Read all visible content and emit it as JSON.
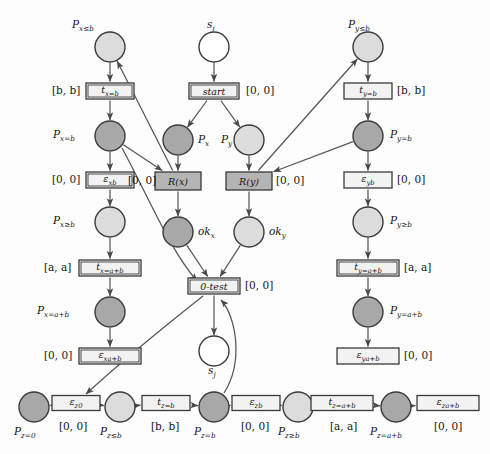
{
  "figure": {
    "kind": "petri-net",
    "colors": {
      "place_dark": "#a8a8a8",
      "place_light": "#dcdcdc",
      "place_white": "#ffffff",
      "transition_light": "#f2f2f2",
      "transition_gray": "#b4b4b4",
      "stroke": "#3a3a3a",
      "arc": "#555555",
      "background": "#fdfdfd"
    }
  },
  "places": [
    {
      "id": "Px_le_b",
      "label": "P",
      "sub": "x≤b",
      "fill": "place_light",
      "x": 110,
      "y": 47,
      "label_x": 72,
      "label_y": 18
    },
    {
      "id": "Px_eq_b",
      "label": "P",
      "sub": "x=b",
      "fill": "place_dark",
      "x": 110,
      "y": 136,
      "label_x": 53,
      "label_y": 128
    },
    {
      "id": "Px_ge_b",
      "label": "P",
      "sub": "x≥b",
      "fill": "place_light",
      "x": 110,
      "y": 222,
      "label_x": 53,
      "label_y": 214
    },
    {
      "id": "Px_eq_ab",
      "label": "P",
      "sub": "x=a+b",
      "fill": "place_dark",
      "x": 110,
      "y": 312,
      "label_x": 37,
      "label_y": 304
    },
    {
      "id": "s_i",
      "label": "s",
      "sub": "i",
      "fill": "place_white",
      "x": 214,
      "y": 47,
      "label_x": 207,
      "label_y": 18
    },
    {
      "id": "P_x",
      "label": "P",
      "sub": "x",
      "fill": "place_dark",
      "x": 178,
      "y": 140,
      "label_x": 198,
      "label_y": 133
    },
    {
      "id": "P_y",
      "label": "P",
      "sub": "y",
      "fill": "place_light",
      "x": 249,
      "y": 140,
      "label_x": 221,
      "label_y": 133
    },
    {
      "id": "ok_x",
      "label": "ok",
      "sub": "x",
      "fill": "place_dark",
      "x": 178,
      "y": 232,
      "label_x": 198,
      "label_y": 225
    },
    {
      "id": "ok_y",
      "label": "ok",
      "sub": "y",
      "fill": "place_light",
      "x": 249,
      "y": 232,
      "label_x": 269,
      "label_y": 225
    },
    {
      "id": "s_j",
      "label": "s",
      "sub": "j",
      "fill": "place_white",
      "x": 214,
      "y": 351,
      "label_x": 208,
      "label_y": 364
    },
    {
      "id": "Py_le_b",
      "label": "P",
      "sub": "y≤b",
      "fill": "place_light",
      "x": 368,
      "y": 47,
      "label_x": 348,
      "label_y": 18
    },
    {
      "id": "Py_eq_b",
      "label": "P",
      "sub": "y=b",
      "fill": "place_dark",
      "x": 368,
      "y": 136,
      "label_x": 390,
      "label_y": 128
    },
    {
      "id": "Py_ge_b",
      "label": "P",
      "sub": "y≥b",
      "fill": "place_light",
      "x": 368,
      "y": 222,
      "label_x": 390,
      "label_y": 214
    },
    {
      "id": "Py_eq_ab",
      "label": "P",
      "sub": "y=a+b",
      "fill": "place_dark",
      "x": 368,
      "y": 312,
      "label_x": 390,
      "label_y": 304
    },
    {
      "id": "Pz_eq_0",
      "label": "P",
      "sub": "z=0",
      "fill": "place_dark",
      "x": 34,
      "y": 407,
      "label_x": 14,
      "label_y": 425
    },
    {
      "id": "Pz_le_b",
      "label": "P",
      "sub": "z≤b",
      "fill": "place_light",
      "x": 120,
      "y": 407,
      "label_x": 100,
      "label_y": 425
    },
    {
      "id": "Pz_eq_b",
      "label": "P",
      "sub": "z=b",
      "fill": "place_dark",
      "x": 214,
      "y": 407,
      "label_x": 194,
      "label_y": 425
    },
    {
      "id": "Pz_ge_b",
      "label": "P",
      "sub": "z≥b",
      "fill": "place_light",
      "x": 298,
      "y": 407,
      "label_x": 278,
      "label_y": 425
    },
    {
      "id": "Pz_eq_ab",
      "label": "P",
      "sub": "z=a+b",
      "fill": "place_dark",
      "x": 396,
      "y": 407,
      "label_x": 370,
      "label_y": 425
    }
  ],
  "transitions": [
    {
      "id": "tx_eq_b",
      "text": "t",
      "sub": "x=b",
      "style": "double",
      "fill": "transition_light",
      "x": 110,
      "y": 91,
      "w": 48,
      "h": 16,
      "iv": "[b, b]",
      "iv_x": 52,
      "iv_y": 84
    },
    {
      "id": "eps_xb",
      "text": "ε",
      "sub": "x_b",
      "style": "double",
      "fill": "transition_light",
      "x": 110,
      "y": 180,
      "w": 48,
      "h": 16,
      "iv": "[0, 0]",
      "iv_x": 52,
      "iv_y": 173
    },
    {
      "id": "tx_eq_ab",
      "text": "t",
      "sub": "x=a+b",
      "style": "double",
      "fill": "transition_light",
      "x": 110,
      "y": 268,
      "w": 62,
      "h": 16,
      "iv": "[a, a]",
      "iv_x": 44,
      "iv_y": 261
    },
    {
      "id": "eps_x_ab",
      "text": "ε",
      "sub": "x_a+b",
      "style": "double",
      "fill": "transition_light",
      "x": 110,
      "y": 356,
      "w": 62,
      "h": 16,
      "iv": "[0, 0]",
      "iv_x": 44,
      "iv_y": 349
    },
    {
      "id": "start",
      "text": "start",
      "sub": "",
      "style": "double",
      "fill": "transition_light",
      "x": 214,
      "y": 91,
      "w": 50,
      "h": 16,
      "iv": "[0, 0]",
      "iv_x": 246,
      "iv_y": 84
    },
    {
      "id": "R_x",
      "text": "R(x)",
      "sub": "",
      "style": "gray",
      "fill": "transition_gray",
      "x": 178,
      "y": 181,
      "w": 46,
      "h": 18,
      "iv": "[0, 0]",
      "iv_x": 128,
      "iv_y": 174
    },
    {
      "id": "R_y",
      "text": "R(y)",
      "sub": "",
      "style": "gray",
      "fill": "transition_gray",
      "x": 249,
      "y": 181,
      "w": 46,
      "h": 18,
      "iv": "[0, 0]",
      "iv_x": 276,
      "iv_y": 174
    },
    {
      "id": "zero_test",
      "text": "0-test",
      "sub": "",
      "style": "double",
      "fill": "transition_light",
      "x": 214,
      "y": 286,
      "w": 52,
      "h": 16,
      "iv": "[0, 0]",
      "iv_x": 245,
      "iv_y": 279
    },
    {
      "id": "ty_eq_b",
      "text": "t",
      "sub": "y=b",
      "style": "single",
      "fill": "transition_light",
      "x": 368,
      "y": 91,
      "w": 48,
      "h": 16,
      "iv": "[b, b]",
      "iv_x": 397,
      "iv_y": 84
    },
    {
      "id": "eps_yb",
      "text": "ε",
      "sub": "y_b",
      "style": "single",
      "fill": "transition_light",
      "x": 368,
      "y": 180,
      "w": 48,
      "h": 16,
      "iv": "[0, 0]",
      "iv_x": 397,
      "iv_y": 173
    },
    {
      "id": "ty_eq_ab",
      "text": "t",
      "sub": "y=a+b",
      "style": "double",
      "fill": "transition_light",
      "x": 368,
      "y": 268,
      "w": 62,
      "h": 16,
      "iv": "[a, a]",
      "iv_x": 404,
      "iv_y": 261
    },
    {
      "id": "eps_y_ab",
      "text": "ε",
      "sub": "y_a+b",
      "style": "single",
      "fill": "transition_light",
      "x": 368,
      "y": 356,
      "w": 62,
      "h": 16,
      "iv": "[0, 0]",
      "iv_x": 404,
      "iv_y": 349
    },
    {
      "id": "eps_z0",
      "text": "ε",
      "sub": "z_0",
      "style": "single",
      "fill": "transition_light",
      "x": 76,
      "y": 403,
      "w": 48,
      "h": 15,
      "iv": "[0, 0]",
      "iv_x": 59,
      "iv_y": 420
    },
    {
      "id": "tz_eq_b",
      "text": "t",
      "sub": "z=b",
      "style": "single",
      "fill": "transition_light",
      "x": 166,
      "y": 403,
      "w": 48,
      "h": 15,
      "iv": "[b, b]",
      "iv_x": 151,
      "iv_y": 420
    },
    {
      "id": "eps_zb",
      "text": "ε",
      "sub": "z_b",
      "style": "single",
      "fill": "transition_light",
      "x": 256,
      "y": 403,
      "w": 48,
      "h": 15,
      "iv": "[0, 0]",
      "iv_x": 241,
      "iv_y": 420
    },
    {
      "id": "tz_eq_ab",
      "text": "t",
      "sub": "z=a+b",
      "style": "single",
      "fill": "transition_light",
      "x": 342,
      "y": 403,
      "w": 62,
      "h": 15,
      "iv": "[a, a]",
      "iv_x": 330,
      "iv_y": 420
    },
    {
      "id": "eps_z_ab",
      "text": "ε",
      "sub": "z_a+b",
      "style": "single",
      "fill": "transition_light",
      "x": 448,
      "y": 403,
      "w": 62,
      "h": 15,
      "iv": "[0, 0]",
      "iv_x": 434,
      "iv_y": 420
    }
  ],
  "arcs": [
    {
      "from": "Px_le_b",
      "to": "tx_eq_b",
      "type": "straight"
    },
    {
      "from": "tx_eq_b",
      "to": "Px_eq_b",
      "type": "straight"
    },
    {
      "from": "Px_eq_b",
      "to": "eps_xb",
      "type": "straight"
    },
    {
      "from": "eps_xb",
      "to": "Px_ge_b",
      "type": "straight"
    },
    {
      "from": "Px_ge_b",
      "to": "tx_eq_ab",
      "type": "straight"
    },
    {
      "from": "tx_eq_ab",
      "to": "Px_eq_ab",
      "type": "straight"
    },
    {
      "from": "Px_eq_ab",
      "to": "eps_x_ab",
      "type": "straight"
    },
    {
      "from": "Px_eq_b",
      "to": "R_x",
      "type": "straight"
    },
    {
      "from": "Px_eq_b",
      "to": "zero_test",
      "type": "curve"
    },
    {
      "from": "R_x",
      "to": "Px_le_b",
      "type": "straight"
    },
    {
      "from": "s_i",
      "to": "start",
      "type": "straight"
    },
    {
      "from": "start",
      "to": "P_x",
      "type": "straight"
    },
    {
      "from": "start",
      "to": "P_y",
      "type": "straight"
    },
    {
      "from": "P_x",
      "to": "R_x",
      "type": "straight"
    },
    {
      "from": "P_y",
      "to": "R_y",
      "type": "straight"
    },
    {
      "from": "R_x",
      "to": "ok_x",
      "type": "straight"
    },
    {
      "from": "R_y",
      "to": "ok_y",
      "type": "straight"
    },
    {
      "from": "ok_x",
      "to": "zero_test",
      "type": "straight"
    },
    {
      "from": "ok_y",
      "to": "zero_test",
      "type": "straight"
    },
    {
      "from": "zero_test",
      "to": "s_j",
      "type": "straight"
    },
    {
      "from": "zero_test",
      "to": "eps_z0",
      "type": "curve"
    },
    {
      "from": "Pz_eq_b",
      "to": "zero_test",
      "type": "curve"
    },
    {
      "from": "Py_le_b",
      "to": "ty_eq_b",
      "type": "straight"
    },
    {
      "from": "ty_eq_b",
      "to": "Py_eq_b",
      "type": "straight"
    },
    {
      "from": "Py_eq_b",
      "to": "eps_yb",
      "type": "straight"
    },
    {
      "from": "eps_yb",
      "to": "Py_ge_b",
      "type": "straight"
    },
    {
      "from": "Py_ge_b",
      "to": "ty_eq_ab",
      "type": "straight"
    },
    {
      "from": "ty_eq_ab",
      "to": "Py_eq_ab",
      "type": "straight"
    },
    {
      "from": "Py_eq_ab",
      "to": "eps_y_ab",
      "type": "straight"
    },
    {
      "from": "Py_eq_b",
      "to": "R_y",
      "type": "straight"
    },
    {
      "from": "R_y",
      "to": "Py_le_b",
      "type": "straight"
    },
    {
      "from": "eps_z0",
      "to": "Pz_eq_0",
      "type": "straight"
    },
    {
      "from": "eps_z0",
      "to": "Pz_le_b",
      "type": "straight"
    },
    {
      "from": "Pz_le_b",
      "to": "tz_eq_b",
      "type": "straight"
    },
    {
      "from": "tz_eq_b",
      "to": "Pz_eq_b",
      "type": "straight"
    },
    {
      "from": "Pz_eq_b",
      "to": "eps_zb",
      "type": "straight"
    },
    {
      "from": "eps_zb",
      "to": "Pz_ge_b",
      "type": "straight"
    },
    {
      "from": "Pz_ge_b",
      "to": "tz_eq_ab",
      "type": "straight"
    },
    {
      "from": "tz_eq_ab",
      "to": "Pz_eq_ab",
      "type": "straight"
    },
    {
      "from": "Pz_eq_ab",
      "to": "eps_z_ab",
      "type": "straight"
    }
  ]
}
